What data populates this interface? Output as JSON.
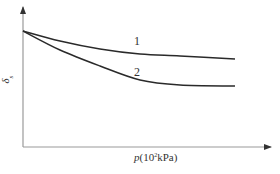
{
  "chart_data": {
    "type": "line",
    "title": "",
    "xlabel": "p(10^2kPa)",
    "xlabel_parts": {
      "var": "p",
      "open": "(10",
      "exp": "2",
      "unit": "kPa)"
    },
    "ylabel": "δs",
    "ylabel_parts": {
      "main": "δ",
      "sub": "s"
    },
    "grid": false,
    "legend": "inline numeric labels",
    "x_ticks": [],
    "y_ticks": [],
    "series": [
      {
        "name": "1",
        "points_px": [
          [
            23,
            31
          ],
          [
            60,
            41
          ],
          [
            100,
            49
          ],
          [
            140,
            54
          ],
          [
            180,
            56
          ],
          [
            235,
            59
          ]
        ],
        "description": "gradually decreasing, then levelling off (upper curve)"
      },
      {
        "name": "2",
        "points_px": [
          [
            23,
            31
          ],
          [
            60,
            50
          ],
          [
            100,
            66
          ],
          [
            140,
            80
          ],
          [
            180,
            85
          ],
          [
            235,
            86
          ]
        ],
        "description": "decreasing more steeply, then levelling off (lower curve)"
      }
    ],
    "annotations": [
      {
        "text": "1",
        "x": 138,
        "y": 44
      },
      {
        "text": "2",
        "x": 138,
        "y": 75
      }
    ]
  },
  "labels": {
    "curve1": "1",
    "curve2": "2",
    "x_var": "p",
    "x_open": "(10",
    "x_exp": "2",
    "x_unit": "kPa)",
    "y_main": "δ",
    "y_sub": "s"
  }
}
